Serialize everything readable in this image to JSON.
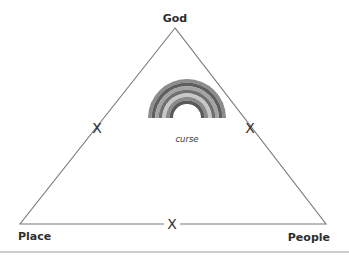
{
  "diagram": {
    "width": 349,
    "height": 259,
    "line_color": "#7a7a7a",
    "text_color": "#2e2e2e",
    "triangle": {
      "apex": [
        175,
        28
      ],
      "left": [
        20,
        224
      ],
      "right": [
        326,
        224
      ]
    },
    "vertices": {
      "top": {
        "label": "God",
        "x": 175,
        "y": 22
      },
      "left": {
        "label": "Place",
        "x": 18,
        "y": 240
      },
      "right": {
        "label": "People",
        "x": 330,
        "y": 241
      }
    },
    "edge_marks": {
      "left": {
        "label": "X",
        "x": 97,
        "y": 133
      },
      "right": {
        "label": "X",
        "x": 250,
        "y": 133
      },
      "bottom": {
        "label": "X",
        "x": 172,
        "y": 229
      }
    },
    "rainbow": {
      "center": [
        187,
        118
      ],
      "outer_radius": 39,
      "inner_radius": 14,
      "band_colors": [
        "#8c8c8c",
        "#5e5e5e",
        "#a3a3a3",
        "#6f6f6f",
        "#c7c7c7",
        "#8a8a8a",
        "#5a5a5a"
      ],
      "label": "curse",
      "label_x": 187,
      "label_y": 142
    },
    "rule": {
      "y": 252,
      "x1": 0,
      "x2": 349,
      "color": "#9a9a9a"
    }
  }
}
